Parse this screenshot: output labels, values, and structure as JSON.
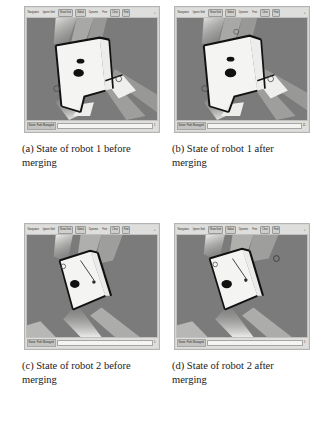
{
  "figure": {
    "colors": {
      "map_background": "#7b7b7b",
      "free_space": "#f2f2f0",
      "obstacle": "#111111",
      "beam": "#d8d8d6",
      "window_chrome": "#d6d6d4",
      "toolbar_background": "#dededc",
      "caption_text": "#1a1a1a"
    },
    "panels": [
      {
        "id": "a",
        "caption": "(a) State of robot 1 before merging",
        "toolbar": {
          "buttons": [
            {
              "label": "Navigation",
              "style": "plain"
            },
            {
              "label": "Ignore Grid",
              "style": "plain"
            },
            {
              "label": "Show Grid",
              "style": "framed"
            },
            {
              "label": "Global",
              "style": "framed"
            },
            {
              "label": "Dynamic",
              "style": "plain"
            },
            {
              "label": "Free",
              "style": "plain"
            },
            {
              "label": "Clear",
              "style": "framed"
            },
            {
              "label": "Find",
              "style": "framed"
            }
          ],
          "overflow_label": "»"
        },
        "status": {
          "label": "Stone: Path Managed",
          "corner": "1"
        },
        "map": {
          "description": "Occupancy grid map of a corridor with robot scan beams, viewed before map merging",
          "beams": 3,
          "obstacle_blobs": 2,
          "waypoint_markers": 2
        }
      },
      {
        "id": "b",
        "caption": "(b) State of robot 1 after merging",
        "toolbar": {
          "buttons": [
            {
              "label": "Navigation",
              "style": "plain"
            },
            {
              "label": "Ignore Grid",
              "style": "plain"
            },
            {
              "label": "Show Grid",
              "style": "framed"
            },
            {
              "label": "Global",
              "style": "framed"
            },
            {
              "label": "Dynamic",
              "style": "plain"
            },
            {
              "label": "Free",
              "style": "plain"
            },
            {
              "label": "Clear",
              "style": "framed"
            },
            {
              "label": "Find",
              "style": "framed"
            }
          ],
          "overflow_label": "»"
        },
        "status": {
          "label": "Stone: Path Managed",
          "corner": "11"
        },
        "map": {
          "description": "Occupancy grid map of the same corridor after merging, with additional merged detail",
          "beams": 3,
          "obstacle_blobs": 2,
          "waypoint_markers": 3
        }
      },
      {
        "id": "c",
        "caption": "(c) State of robot 2 before merging",
        "toolbar": {
          "buttons": [
            {
              "label": "Navigation",
              "style": "plain"
            },
            {
              "label": "Ignore Grid",
              "style": "plain"
            },
            {
              "label": "Show Grid",
              "style": "framed"
            },
            {
              "label": "Global",
              "style": "framed"
            },
            {
              "label": "Dynamic",
              "style": "plain"
            },
            {
              "label": "Free",
              "style": "plain"
            },
            {
              "label": "Clear",
              "style": "framed"
            },
            {
              "label": "Find",
              "style": "framed"
            }
          ],
          "overflow_label": "»"
        },
        "status": {
          "label": "Stone: Path Managed",
          "corner": "1"
        },
        "map": {
          "description": "Occupancy grid map from the second robot before merging, tilted corridor view",
          "beams": 3,
          "obstacle_blobs": 1,
          "waypoint_markers": 1
        }
      },
      {
        "id": "d",
        "caption": "(d) State of robot 2 after merging",
        "toolbar": {
          "buttons": [
            {
              "label": "Navigation",
              "style": "plain"
            },
            {
              "label": "Ignore Grid",
              "style": "plain"
            },
            {
              "label": "Show Grid",
              "style": "framed"
            },
            {
              "label": "Global",
              "style": "framed"
            },
            {
              "label": "Dynamic",
              "style": "plain"
            },
            {
              "label": "Free",
              "style": "plain"
            },
            {
              "label": "Clear",
              "style": "framed"
            },
            {
              "label": "Find",
              "style": "framed"
            }
          ],
          "overflow_label": "»"
        },
        "status": {
          "label": "Stone: Path Managed",
          "corner": "1"
        },
        "map": {
          "description": "Occupancy grid map from the second robot after merging, with extra marker at upper right",
          "beams": 3,
          "obstacle_blobs": 1,
          "waypoint_markers": 2
        }
      }
    ]
  }
}
